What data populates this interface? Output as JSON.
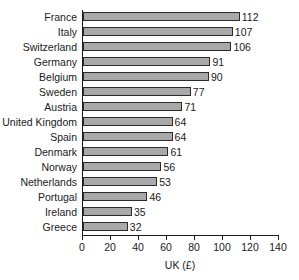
{
  "chart_data": {
    "type": "bar",
    "orientation": "horizontal",
    "title": "",
    "xlabel": "UK (£)",
    "ylabel": "",
    "xlim": [
      0,
      140
    ],
    "xticks": [
      0,
      20,
      40,
      60,
      80,
      100,
      120,
      140
    ],
    "grid": false,
    "legend": null,
    "categories": [
      "France",
      "Italy",
      "Switzerland",
      "Germany",
      "Belgium",
      "Sweden",
      "Austria",
      "United Kingdom",
      "Spain",
      "Denmark",
      "Norway",
      "Netherlands",
      "Portugal",
      "Ireland",
      "Greece"
    ],
    "values": [
      112,
      107,
      106,
      91,
      90,
      77,
      71,
      64,
      64,
      61,
      56,
      53,
      46,
      35,
      32
    ],
    "bar_color": "#a9a9a9",
    "bar_edge_color": "#2b2b2b",
    "axis_color": "#1a1a1a",
    "background_color": "#ffffff"
  }
}
